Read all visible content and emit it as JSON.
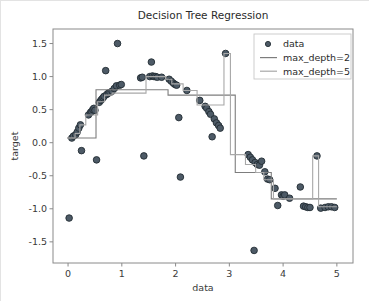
{
  "figure": {
    "background_color": "#ffffff",
    "border_color": "#e3e3e3",
    "axes_color": "#8a8a8a",
    "text_color": "#3a3a3a"
  },
  "chart_data": {
    "type": "scatter",
    "title": "Decision Tree Regression",
    "xlabel": "data",
    "ylabel": "target",
    "xlim": [
      -0.28,
      5.3
    ],
    "ylim": [
      -1.82,
      1.72
    ],
    "xticks": [
      0,
      1,
      2,
      3,
      4,
      5
    ],
    "xticklabels": [
      "0",
      "1",
      "2",
      "3",
      "4",
      "5"
    ],
    "yticks": [
      -1.5,
      -1.0,
      -0.5,
      0.0,
      0.5,
      1.0,
      1.5
    ],
    "yticklabels": [
      "-1.5",
      "-1.0",
      "-0.5",
      "0.0",
      "0.5",
      "1.0",
      "1.5"
    ],
    "grid": false,
    "legend_position": "upper right",
    "legend": [
      {
        "label": "data",
        "marker": "circle",
        "color": "#4d5a66"
      },
      {
        "label": "max_depth=2",
        "marker": "line",
        "color": "#7d7d7d"
      },
      {
        "label": "max_depth=5",
        "marker": "line",
        "color": "#a8a8a8"
      }
    ],
    "series": [
      {
        "name": "data",
        "type": "scatter",
        "marker_color": "#4d5a66",
        "marker_edge_color": "#232c33",
        "marker_size": 4.2,
        "points": [
          [
            0.02,
            -1.14
          ],
          [
            0.07,
            0.07
          ],
          [
            0.1,
            0.1
          ],
          [
            0.14,
            0.12
          ],
          [
            0.17,
            0.16
          ],
          [
            0.2,
            0.22
          ],
          [
            0.23,
            0.27
          ],
          [
            0.25,
            -0.12
          ],
          [
            0.38,
            0.42
          ],
          [
            0.42,
            0.46
          ],
          [
            0.44,
            0.47
          ],
          [
            0.46,
            0.5
          ],
          [
            0.48,
            0.52
          ],
          [
            0.5,
            0.49
          ],
          [
            0.53,
            -0.26
          ],
          [
            0.58,
            0.61
          ],
          [
            0.61,
            0.64
          ],
          [
            0.63,
            0.66
          ],
          [
            0.65,
            0.68
          ],
          [
            0.67,
            0.7
          ],
          [
            0.7,
            1.09
          ],
          [
            0.72,
            0.73
          ],
          [
            0.75,
            0.75
          ],
          [
            0.78,
            0.76
          ],
          [
            0.82,
            0.78
          ],
          [
            0.86,
            0.82
          ],
          [
            0.9,
            0.86
          ],
          [
            0.92,
            1.5
          ],
          [
            0.96,
            0.87
          ],
          [
            0.99,
            0.88
          ],
          [
            1.35,
            0.98
          ],
          [
            1.38,
            0.99
          ],
          [
            1.41,
            -0.2
          ],
          [
            1.52,
            1.0
          ],
          [
            1.55,
            1.22
          ],
          [
            1.57,
            1.01
          ],
          [
            1.6,
            1.0
          ],
          [
            1.63,
            1.0
          ],
          [
            1.66,
            0.99
          ],
          [
            1.74,
            0.99
          ],
          [
            1.88,
            0.96
          ],
          [
            1.92,
            0.93
          ],
          [
            1.96,
            0.9
          ],
          [
            1.99,
            0.88
          ],
          [
            2.02,
            0.87
          ],
          [
            2.06,
            0.38
          ],
          [
            2.09,
            -0.52
          ],
          [
            2.21,
            0.79
          ],
          [
            2.45,
            0.64
          ],
          [
            2.55,
            0.55
          ],
          [
            2.58,
            0.52
          ],
          [
            2.62,
            0.47
          ],
          [
            2.65,
            0.43
          ],
          [
            2.68,
            0.09
          ],
          [
            2.72,
            0.36
          ],
          [
            2.76,
            0.3
          ],
          [
            2.8,
            0.26
          ],
          [
            2.83,
            0.22
          ],
          [
            2.93,
            1.35
          ],
          [
            3.35,
            -0.18
          ],
          [
            3.39,
            -0.22
          ],
          [
            3.43,
            -0.26
          ],
          [
            3.46,
            -1.63
          ],
          [
            3.48,
            -0.3
          ],
          [
            3.52,
            -0.33
          ],
          [
            3.56,
            -0.34
          ],
          [
            3.6,
            -0.28
          ],
          [
            3.66,
            -0.44
          ],
          [
            3.71,
            -0.55
          ],
          [
            3.75,
            -0.56
          ],
          [
            3.85,
            -0.69
          ],
          [
            3.9,
            -0.95
          ],
          [
            3.97,
            -0.79
          ],
          [
            4.0,
            -0.81
          ],
          [
            4.03,
            -0.79
          ],
          [
            4.12,
            -0.84
          ],
          [
            4.32,
            -0.67
          ],
          [
            4.38,
            -0.96
          ],
          [
            4.42,
            -0.97
          ],
          [
            4.46,
            -0.98
          ],
          [
            4.5,
            -0.98
          ],
          [
            4.63,
            -0.2
          ],
          [
            4.7,
            -0.99
          ],
          [
            4.78,
            -0.98
          ],
          [
            4.84,
            -0.97
          ],
          [
            4.9,
            -0.97
          ],
          [
            4.96,
            -0.98
          ]
        ]
      },
      {
        "name": "max_depth=2",
        "type": "step",
        "color": "#7d7d7d",
        "linewidth": 1.1,
        "steps": [
          {
            "x0": -0.02,
            "x1": 0.52,
            "y": 0.07
          },
          {
            "x0": 0.52,
            "x1": 1.86,
            "y": 0.8
          },
          {
            "x0": 1.86,
            "x1": 3.11,
            "y": 0.72
          },
          {
            "x0": 3.11,
            "x1": 3.78,
            "y": -0.45
          },
          {
            "x0": 3.78,
            "x1": 5.0,
            "y": -0.85
          }
        ]
      },
      {
        "name": "max_depth=5",
        "type": "step",
        "color": "#a8a8a8",
        "linewidth": 1.1,
        "steps": [
          {
            "x0": -0.02,
            "x1": 0.13,
            "y": 0.07
          },
          {
            "x0": 0.13,
            "x1": 0.22,
            "y": 0.14
          },
          {
            "x0": 0.22,
            "x1": 0.33,
            "y": 0.27
          },
          {
            "x0": 0.33,
            "x1": 0.55,
            "y": 0.42
          },
          {
            "x0": 0.55,
            "x1": 0.68,
            "y": 0.62
          },
          {
            "x0": 0.68,
            "x1": 0.82,
            "y": 0.72
          },
          {
            "x0": 0.82,
            "x1": 1.45,
            "y": 0.75
          },
          {
            "x0": 1.45,
            "x1": 1.82,
            "y": 1.0
          },
          {
            "x0": 1.82,
            "x1": 1.93,
            "y": 0.96
          },
          {
            "x0": 1.93,
            "x1": 2.14,
            "y": 0.89
          },
          {
            "x0": 2.14,
            "x1": 2.4,
            "y": 0.79
          },
          {
            "x0": 2.4,
            "x1": 2.9,
            "y": 0.57
          },
          {
            "x0": 2.9,
            "x1": 3.02,
            "y": 1.35
          },
          {
            "x0": 3.02,
            "x1": 3.3,
            "y": -0.18
          },
          {
            "x0": 3.3,
            "x1": 3.49,
            "y": -0.33
          },
          {
            "x0": 3.49,
            "x1": 3.64,
            "y": -0.45
          },
          {
            "x0": 3.64,
            "x1": 3.82,
            "y": -0.56
          },
          {
            "x0": 3.82,
            "x1": 4.55,
            "y": -0.85
          },
          {
            "x0": 4.55,
            "x1": 4.66,
            "y": -0.2
          },
          {
            "x0": 4.66,
            "x1": 5.0,
            "y": -0.97
          }
        ]
      }
    ]
  }
}
